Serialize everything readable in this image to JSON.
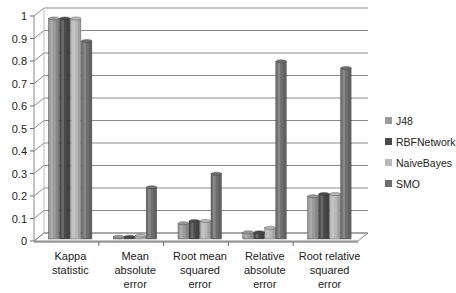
{
  "chart_data": {
    "type": "bar",
    "title": "",
    "xlabel": "",
    "ylabel": "",
    "ylim": [
      0,
      1
    ],
    "yticks": [
      "0",
      "0.1",
      "0.2",
      "0.3",
      "0.4",
      "0.5",
      "0.6",
      "0.7",
      "0.8",
      "0.9",
      "1"
    ],
    "grid": true,
    "style": "3d-clustered-column",
    "legend_position": "right",
    "categories": [
      [
        "Kappa",
        "statistic"
      ],
      [
        "Mean",
        "absolute",
        "error"
      ],
      [
        "Root mean",
        "squared",
        "error"
      ],
      [
        "Relative",
        "absolute",
        "error"
      ],
      [
        "Root relative",
        "squared",
        "error"
      ]
    ],
    "series": [
      {
        "name": "J48",
        "color": "#9a9a9a",
        "values": [
          0.98,
          0.01,
          0.07,
          0.03,
          0.19
        ]
      },
      {
        "name": "RBFNetwork",
        "color": "#4a4a4a",
        "values": [
          0.98,
          0.01,
          0.08,
          0.03,
          0.2
        ]
      },
      {
        "name": "NaiveBayes",
        "color": "#b8b8b8",
        "values": [
          0.98,
          0.015,
          0.08,
          0.05,
          0.2
        ]
      },
      {
        "name": "SMO",
        "color": "#6e6e6e",
        "values": [
          0.88,
          0.23,
          0.29,
          0.79,
          0.76
        ]
      }
    ]
  }
}
